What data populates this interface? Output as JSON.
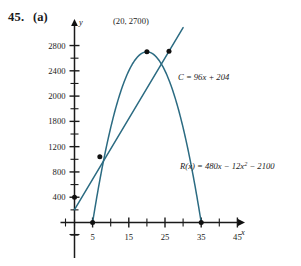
{
  "figure": {
    "exercise_number": "45.",
    "part_label": "(a)"
  },
  "chart_data": {
    "type": "line",
    "title": "",
    "xlabel": "x",
    "ylabel": "y",
    "xlim": [
      -4,
      50
    ],
    "ylim": [
      -420,
      3050
    ],
    "grid": false,
    "legend": "none",
    "x_ticks_labeled": [
      5,
      15,
      25,
      35,
      45
    ],
    "x_ticks_minor": [
      0,
      10,
      20,
      30,
      40
    ],
    "x_tick_labels": [
      "5",
      "15",
      "25",
      "35",
      "45"
    ],
    "y_ticks_labeled": [
      400,
      800,
      1200,
      1600,
      2000,
      2400,
      2800
    ],
    "y_tick_labels": [
      "400",
      "800",
      "1200",
      "1800",
      "2000",
      "2400",
      "2800"
    ],
    "y_ticks_minor": [
      -200,
      200,
      600,
      1000,
      1400,
      1800,
      2200,
      2600
    ],
    "series": [
      {
        "name": "C",
        "kind": "line",
        "equation_label": "C = 96x + 204",
        "color": "#2b6b82",
        "slope": 96,
        "intercept": 204,
        "x_start": 0,
        "x_end": 30,
        "points": [
          {
            "x": 0,
            "y": 204
          },
          {
            "x": 30,
            "y": 3084
          }
        ]
      },
      {
        "name": "R",
        "kind": "parabola",
        "equation_label": "R(x) = 480x − 12x",
        "equation_exponent": "2",
        "equation_tail": " − 2100",
        "color": "#2b6b82",
        "a": -12,
        "b": 480,
        "c": -2100,
        "vertex": {
          "x": 20,
          "y": 2700
        },
        "roots": [
          5,
          35
        ],
        "x_start": 5,
        "x_end": 35
      }
    ],
    "annotations": [
      {
        "name": "vertex-label",
        "text": "(20, 2700)",
        "x": 20,
        "y": 2700
      },
      {
        "name": "cost-equation-label",
        "text": "C = 96x + 204"
      },
      {
        "name": "revenue-equation-label",
        "text": "R(x) = 480x − 12x2 − 2100"
      }
    ],
    "marked_points": [
      {
        "name": "vertex-point",
        "x": 20,
        "y": 2700
      },
      {
        "name": "upper-intersection-point",
        "x": 26.1,
        "y": 2710
      },
      {
        "name": "lower-intersection-point",
        "x": 7.0,
        "y": 1040
      },
      {
        "name": "cost-y-intercept-point",
        "x": 0,
        "y": 400
      },
      {
        "name": "revenue-root-left-point",
        "x": 5,
        "y": 0
      },
      {
        "name": "revenue-root-right-point",
        "x": 35,
        "y": 0
      }
    ]
  }
}
